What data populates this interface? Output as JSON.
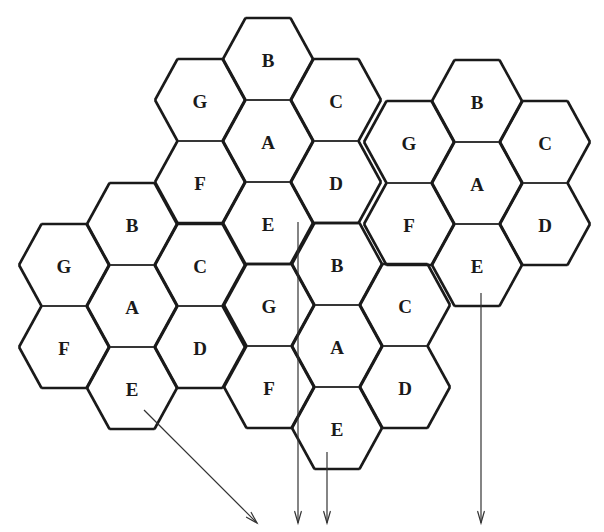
{
  "diagram": {
    "colors": {
      "stroke": "#2a2a2a",
      "border": "#1a1a1a",
      "text": "#1a1a1a",
      "background": "#ffffff"
    },
    "hex": {
      "radius": 45,
      "dx": 68,
      "dy": 41
    },
    "cell_offsets": {
      "A": [
        0,
        0
      ],
      "B": [
        0,
        -2
      ],
      "C": [
        1,
        -1
      ],
      "D": [
        1,
        1
      ],
      "E": [
        0,
        2
      ],
      "F": [
        -1,
        1
      ],
      "G": [
        -1,
        -1
      ]
    },
    "clusters": [
      {
        "id": "top",
        "center": [
          268,
          141
        ],
        "cells": [
          "A",
          "B",
          "C",
          "D",
          "E",
          "F",
          "G"
        ]
      },
      {
        "id": "right",
        "center": [
          477,
          183
        ],
        "cells": [
          "A",
          "B",
          "C",
          "D",
          "E",
          "F",
          "G"
        ]
      },
      {
        "id": "left",
        "center": [
          132,
          306
        ],
        "cells": [
          "A",
          "B",
          "C",
          "D",
          "E",
          "F",
          "G"
        ]
      },
      {
        "id": "bottom",
        "center": [
          337,
          346
        ],
        "cells": [
          "A",
          "B",
          "C",
          "D",
          "E",
          "F",
          "G"
        ]
      }
    ],
    "arrows": [
      {
        "id": "arrow-left-e",
        "from": [
          144,
          410
        ],
        "to": [
          257,
          523
        ]
      },
      {
        "id": "arrow-top-e",
        "from": [
          298,
          222
        ],
        "to": [
          298,
          523
        ]
      },
      {
        "id": "arrow-bottom-e",
        "from": [
          327,
          452
        ],
        "to": [
          327,
          523
        ]
      },
      {
        "id": "arrow-right-e",
        "from": [
          481,
          293
        ],
        "to": [
          481,
          523
        ]
      }
    ]
  }
}
